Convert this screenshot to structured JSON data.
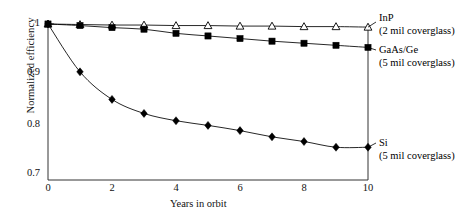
{
  "chart_data": {
    "type": "line",
    "title": "",
    "xlabel": "Years in orbit",
    "ylabel": "Normalized efficiency",
    "xlim": [
      0,
      10
    ],
    "ylim": [
      0.7,
      1.0
    ],
    "xticks": [
      "0",
      "2",
      "4",
      "6",
      "8",
      "10"
    ],
    "xtick_values": [
      0,
      2,
      4,
      6,
      8,
      10
    ],
    "yticks": [
      "0.7",
      "0.8",
      "0.9",
      "1"
    ],
    "ytick_values": [
      0.7,
      0.8,
      0.9,
      1.0
    ],
    "grid": false,
    "legend_position": "right-inline",
    "x": [
      0,
      1,
      2,
      3,
      4,
      5,
      6,
      7,
      8,
      9,
      10
    ],
    "series": [
      {
        "name": "InP",
        "sublabel": "(2 mil coverglass)",
        "marker": "open-triangle",
        "color": "#000000",
        "values": [
          1.0,
          0.999,
          0.998,
          0.998,
          0.997,
          0.997,
          0.996,
          0.996,
          0.995,
          0.995,
          0.994
        ]
      },
      {
        "name": "GaAs/Ge",
        "sublabel": "(5 mil coverglass)",
        "marker": "filled-square",
        "color": "#000000",
        "values": [
          1.0,
          0.997,
          0.993,
          0.99,
          0.982,
          0.977,
          0.972,
          0.967,
          0.963,
          0.959,
          0.955
        ]
      },
      {
        "name": "Si",
        "sublabel": "(5 mil coverglass)",
        "marker": "filled-diamond",
        "color": "#000000",
        "values": [
          1.0,
          0.908,
          0.855,
          0.828,
          0.814,
          0.805,
          0.795,
          0.783,
          0.774,
          0.763,
          0.763
        ]
      }
    ]
  },
  "axes": {
    "x_title": "Years in orbit",
    "y_title": "Normalized efficiency"
  },
  "legend": {
    "inp": {
      "name": "InP",
      "sub": "(2 mil coverglass)"
    },
    "gaas": {
      "name": "GaAs/Ge",
      "sub": "(5 mil coverglass)"
    },
    "si": {
      "name": "Si",
      "sub": "(5 mil coverglass)"
    }
  }
}
